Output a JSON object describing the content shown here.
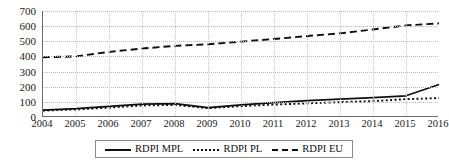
{
  "chart_data": {
    "type": "line",
    "title": "",
    "xlabel": "",
    "ylabel": "",
    "ylim": [
      0,
      700
    ],
    "yticks": [
      0,
      100,
      200,
      300,
      400,
      500,
      600,
      700
    ],
    "grid": true,
    "legend_position": "bottom",
    "categories": [
      "2004",
      "2005",
      "2006",
      "2007",
      "2008",
      "2009",
      "2010",
      "2011",
      "2012",
      "2013",
      "2014",
      "2015",
      "2016"
    ],
    "series": [
      {
        "name": "RDPI MPL",
        "style": "solid",
        "color": "#0f0f0f",
        "values": [
          45,
          55,
          70,
          85,
          88,
          62,
          80,
          95,
          108,
          118,
          128,
          140,
          215
        ]
      },
      {
        "name": "RDPI PL",
        "style": "dotted",
        "color": "#0f0f0f",
        "values": [
          42,
          50,
          62,
          76,
          80,
          58,
          72,
          82,
          90,
          98,
          105,
          118,
          125
        ]
      },
      {
        "name": "RDPI EU",
        "style": "dashed",
        "color": "#0f0f0f",
        "values": [
          395,
          400,
          430,
          452,
          470,
          480,
          498,
          515,
          535,
          552,
          578,
          605,
          618
        ]
      }
    ]
  },
  "legend": {
    "items": [
      {
        "label": "RDPI MPL",
        "swatch": "solid-line-icon"
      },
      {
        "label": "RDPI PL",
        "swatch": "dotted-line-icon"
      },
      {
        "label": "RDPI EU",
        "swatch": "dashed-line-icon"
      }
    ]
  }
}
